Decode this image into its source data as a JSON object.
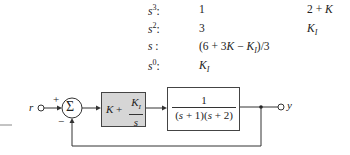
{
  "routh_array": {
    "rows": [
      {
        "power": "s³:",
        "col1": "1",
        "col2": "2 + K"
      },
      {
        "power": "s²:",
        "col1": "3",
        "col2": "K_I"
      },
      {
        "power": "s :",
        "col1": "(6 + 3K − K_I)/3",
        "col2": ""
      },
      {
        "power": "s⁰:",
        "col1": "K_I",
        "col2": ""
      }
    ]
  },
  "block_diagram": {
    "input_label": "r",
    "output_label": "y",
    "summer_symbol": "Σ",
    "summer_plus": "+",
    "summer_minus": "−",
    "controller": {
      "prefix": "K +",
      "numerator": "K_I",
      "denominator": "s",
      "fill": "#d6d6d6"
    },
    "plant": {
      "numerator": "1",
      "denominator": "(s + 1)(s + 2)"
    }
  }
}
